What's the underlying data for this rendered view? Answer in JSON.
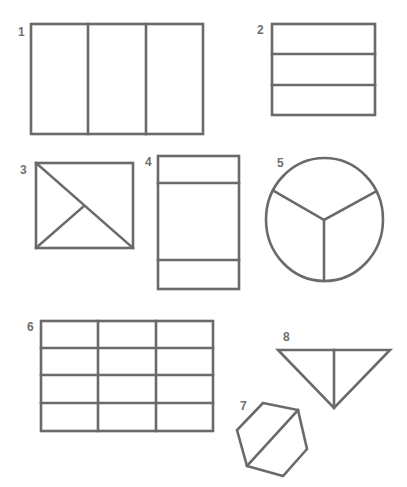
{
  "diagram": {
    "title": "",
    "line_color": "#6a6a6a",
    "label_color": "#6f6f6f",
    "figures": [
      {
        "id": "1",
        "label": "1",
        "description": "Rectangle divided vertically into 3 equal parts"
      },
      {
        "id": "2",
        "label": "2",
        "description": "Rectangle divided horizontally into 3 equal parts"
      },
      {
        "id": "3",
        "label": "3",
        "description": "Rectangle divided into 3 triangular parts by a diagonal and a line"
      },
      {
        "id": "4",
        "label": "4",
        "description": "Rectangle divided horizontally into 3 unequal parts"
      },
      {
        "id": "5",
        "label": "5",
        "description": "Circle divided into 3 equal sectors"
      },
      {
        "id": "6",
        "label": "6",
        "description": "Rectangle divided into 12 equal parts (3 columns x 4 rows)"
      },
      {
        "id": "7",
        "label": "7",
        "description": "Hexagon divided into 2 equal parts by a diagonal"
      },
      {
        "id": "8",
        "label": "8",
        "description": "Triangle divided into 2 equal parts by a vertical line"
      }
    ]
  }
}
